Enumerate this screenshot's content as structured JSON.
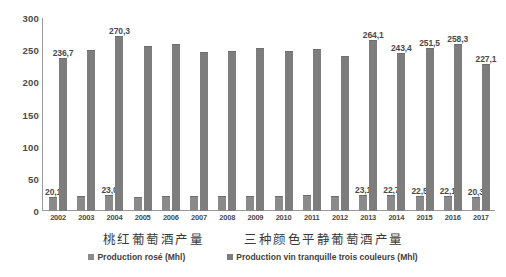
{
  "chart_data": {
    "type": "bar",
    "title": "",
    "xlabel": "",
    "ylabel": "",
    "ylim": [
      0,
      300
    ],
    "yticks": [
      300,
      250,
      200,
      150,
      100,
      50,
      0
    ],
    "grid": false,
    "legend_position": "bottom",
    "categories": [
      "2002",
      "2003",
      "2004",
      "2005",
      "2006",
      "2007",
      "2008",
      "2009",
      "2010",
      "2011",
      "2012",
      "2013",
      "2014",
      "2015",
      "2016",
      "2017"
    ],
    "series": [
      {
        "name": "Production rosé (Mhl)",
        "color": "#8a8a8a",
        "values": [
          20.1,
          21.2,
          23.0,
          21.0,
          21.6,
          21.8,
          22.0,
          22.4,
          22.2,
          22.6,
          21.4,
          23.1,
          22.7,
          22.5,
          22.1,
          20.3
        ],
        "labels": [
          "20,1",
          "",
          "23,0",
          "",
          "",
          "",
          "",
          "",
          "",
          "",
          "",
          "23,1",
          "22,7",
          "22,5",
          "22,1",
          "20,3"
        ]
      },
      {
        "name": "Production vin tranquille trois couleurs (Mhl)",
        "color": "#7d7d7d",
        "values": [
          236.7,
          248.0,
          270.3,
          255.0,
          258.0,
          245.0,
          247.0,
          252.0,
          247.0,
          250.0,
          240.0,
          264.1,
          243.4,
          251.5,
          258.3,
          227.1
        ],
        "labels": [
          "236,7",
          "",
          "270,3",
          "",
          "",
          "",
          "",
          "",
          "",
          "",
          "",
          "264,1",
          "243,4",
          "251,5",
          "258,3",
          "227,1"
        ]
      }
    ],
    "captions": [
      "桃红葡萄酒产量",
      "三种颜色平静葡萄酒产量"
    ]
  }
}
